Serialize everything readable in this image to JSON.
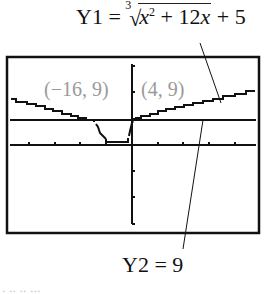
{
  "equations": {
    "y1_name": "Y1",
    "y1_eq": "=",
    "y1_root_index": "3",
    "y1_radicand_x": "x",
    "y1_radicand_exp": "2",
    "y1_radicand_rest": " + 12",
    "y1_radicand_x2": "x",
    "y1_tail": " + 5",
    "y2": "Y2 = 9"
  },
  "points": {
    "left": "(−16, 9)",
    "right": "(4, 9)"
  },
  "footer_cut_text": "∙ ∙∙ ∙∙ ∙∙∙"
}
